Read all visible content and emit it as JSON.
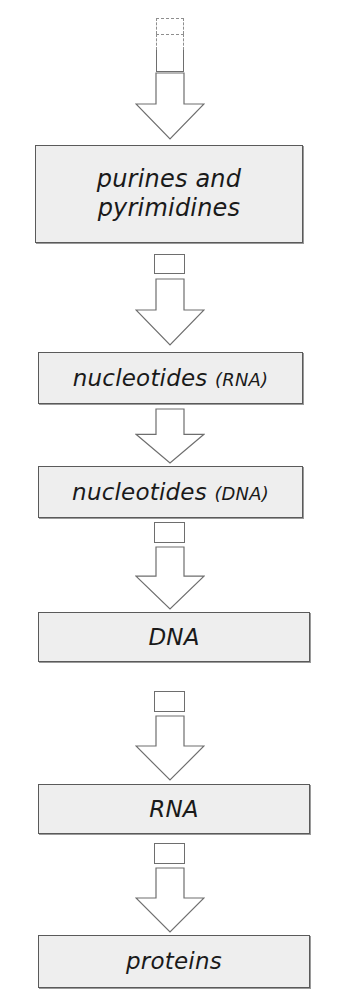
{
  "diagram": {
    "type": "flow-diagram",
    "orientation": "vertical-top-to-bottom",
    "canvas": {
      "width": 338,
      "height": 1008
    },
    "palette": {
      "background": "#ffffff",
      "box_fill": "#eeeeee",
      "box_border": "#5a5a5a",
      "box_shadow": "#9a9a9a",
      "arrow_fill": "#ffffff",
      "arrow_stroke": "#6e6e6e",
      "text": "#1a1a1a",
      "dashed_stroke": "#8e8e8e"
    },
    "top_stub": {
      "name": "continuation-marker",
      "style": "dashed-open-top",
      "label": ""
    },
    "nodes": [
      {
        "id": "purines-pyrimidines",
        "label": "purines and\npyrimidines",
        "qualifier": "",
        "lines": [
          "purines and",
          "pyrimidines"
        ],
        "size": "size-lg",
        "x": 35,
        "y": 145,
        "width": 268,
        "height": 98
      },
      {
        "id": "nucleotides-rna",
        "label": "nucleotides",
        "qualifier": "(RNA)",
        "lines": [
          "nucleotides (RNA)"
        ],
        "size": "size-md",
        "x": 38,
        "y": 352,
        "width": 265,
        "height": 52
      },
      {
        "id": "nucleotides-dna",
        "label": "nucleotides",
        "qualifier": "(DNA)",
        "lines": [
          "nucleotides (DNA)"
        ],
        "size": "size-md",
        "x": 38,
        "y": 466,
        "width": 265,
        "height": 52
      },
      {
        "id": "dna",
        "label": "DNA",
        "qualifier": "",
        "lines": [
          "DNA"
        ],
        "size": "size-md",
        "x": 38,
        "y": 612,
        "width": 272,
        "height": 50
      },
      {
        "id": "rna",
        "label": "RNA",
        "qualifier": "",
        "lines": [
          "RNA"
        ],
        "size": "size-md",
        "x": 38,
        "y": 784,
        "width": 272,
        "height": 50
      },
      {
        "id": "proteins",
        "label": "proteins",
        "qualifier": "",
        "lines": [
          "proteins"
        ],
        "size": "size-md",
        "x": 38,
        "y": 935,
        "width": 272,
        "height": 53
      }
    ],
    "arrows": [
      {
        "id": "arrow-to-purines",
        "from": "continuation-marker",
        "to": "purines-pyrimidines",
        "has_regulator_box": false,
        "x": 135,
        "y": 72,
        "width": 70,
        "height": 68
      },
      {
        "id": "arrow-to-nucleotides-rna",
        "from": "purines-pyrimidines",
        "to": "nucleotides-rna",
        "has_regulator_box": true,
        "x": 135,
        "y": 278,
        "width": 70,
        "height": 68,
        "reg_x": 154,
        "reg_y": 254,
        "reg_w": 31,
        "reg_h": 20
      },
      {
        "id": "arrow-to-nucleotides-dna",
        "from": "nucleotides-rna",
        "to": "nucleotides-dna",
        "has_regulator_box": false,
        "x": 135,
        "y": 408,
        "width": 70,
        "height": 56
      },
      {
        "id": "arrow-to-dna",
        "from": "nucleotides-dna",
        "to": "dna",
        "has_regulator_box": true,
        "x": 135,
        "y": 546,
        "width": 70,
        "height": 64,
        "reg_x": 154,
        "reg_y": 522,
        "reg_w": 31,
        "reg_h": 21
      },
      {
        "id": "arrow-to-rna",
        "from": "dna",
        "to": "rna",
        "has_regulator_box": true,
        "x": 135,
        "y": 715,
        "width": 70,
        "height": 66,
        "reg_x": 154,
        "reg_y": 691,
        "reg_w": 31,
        "reg_h": 21
      },
      {
        "id": "arrow-to-proteins",
        "from": "rna",
        "to": "proteins",
        "has_regulator_box": true,
        "x": 135,
        "y": 867,
        "width": 70,
        "height": 66,
        "reg_x": 154,
        "reg_y": 843,
        "reg_w": 31,
        "reg_h": 21
      }
    ]
  }
}
